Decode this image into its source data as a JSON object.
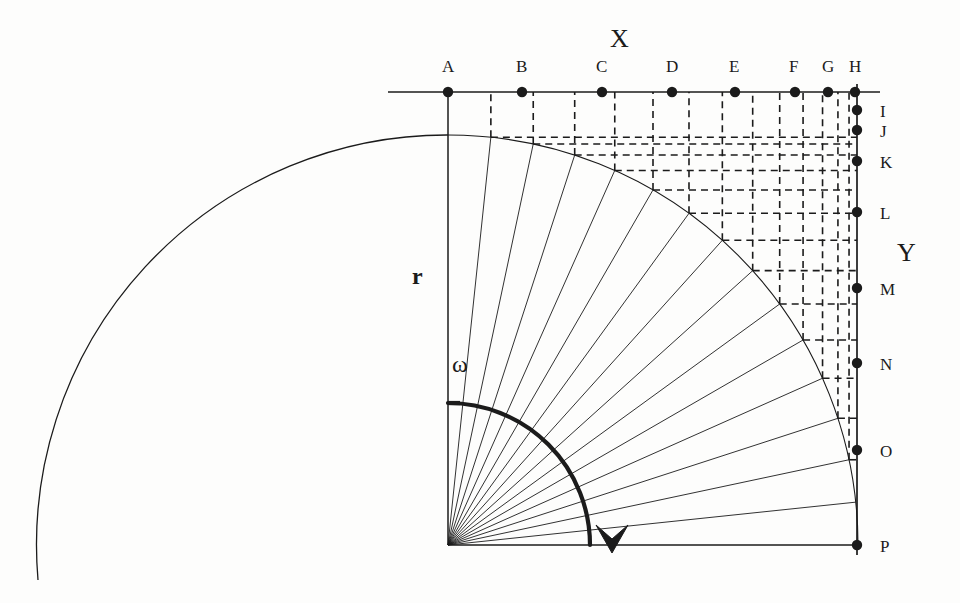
{
  "figure": {
    "type": "geometric-construction",
    "background_color": "#fdfdfc",
    "ink_color": "#1b1b1b"
  },
  "axes": {
    "x_label": "X",
    "y_label": "Y",
    "radius_label": "r",
    "angle_label": "ω"
  },
  "geometry": {
    "origin": {
      "x": 448,
      "y": 545
    },
    "radius": 410,
    "sector_count": 15,
    "small_arc_radius": 142,
    "big_arc": {
      "cx": 448,
      "cy": 545,
      "r": 410,
      "start_deg": 90,
      "end_deg": 180
    }
  },
  "x_axis_points": [
    {
      "label": "A",
      "x": 448,
      "y": 92,
      "label_x": 442,
      "label_y": 58
    },
    {
      "label": "B",
      "x": 522,
      "y": 92,
      "label_x": 516,
      "label_y": 58
    },
    {
      "label": "C",
      "x": 602,
      "y": 92,
      "label_x": 596,
      "label_y": 58
    },
    {
      "label": "D",
      "x": 672,
      "y": 92,
      "label_x": 666,
      "label_y": 58
    },
    {
      "label": "E",
      "x": 735,
      "y": 92,
      "label_x": 729,
      "label_y": 58
    },
    {
      "label": "F",
      "x": 795,
      "y": 92,
      "label_x": 789,
      "label_y": 58
    },
    {
      "label": "G",
      "x": 828,
      "y": 92,
      "label_x": 822,
      "label_y": 58
    },
    {
      "label": "H",
      "x": 855,
      "y": 92,
      "label_x": 849,
      "label_y": 58
    }
  ],
  "y_axis_points": [
    {
      "label": "I",
      "x": 857,
      "y": 110,
      "label_x": 880,
      "label_y": 103
    },
    {
      "label": "J",
      "x": 857,
      "y": 130,
      "label_x": 880,
      "label_y": 123
    },
    {
      "label": "K",
      "x": 857,
      "y": 161,
      "label_x": 880,
      "label_y": 154
    },
    {
      "label": "L",
      "x": 857,
      "y": 212,
      "label_x": 880,
      "label_y": 205
    },
    {
      "label": "M",
      "x": 857,
      "y": 288,
      "label_x": 880,
      "label_y": 281
    },
    {
      "label": "N",
      "x": 857,
      "y": 363,
      "label_x": 880,
      "label_y": 356
    },
    {
      "label": "O",
      "x": 857,
      "y": 450,
      "label_x": 880,
      "label_y": 443
    },
    {
      "label": "P",
      "x": 857,
      "y": 545,
      "label_x": 880,
      "label_y": 538
    }
  ],
  "axis_label_positions": {
    "x": {
      "x": 610,
      "y": 26
    },
    "y": {
      "x": 897,
      "y": 240
    },
    "r": {
      "x": 412,
      "y": 264
    },
    "omega": {
      "x": 452,
      "y": 352
    }
  },
  "arc_arrow": {
    "tip_x": 612,
    "tip_y": 553,
    "note": "bold quarter arc with downward arrowhead indicating rotation direction"
  }
}
